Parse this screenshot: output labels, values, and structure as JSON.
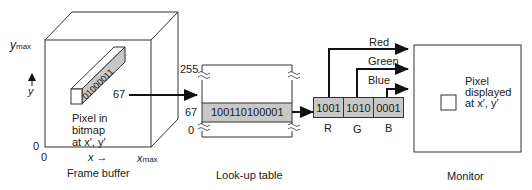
{
  "frame_buffer": {
    "caption": "Frame buffer",
    "y_axis": {
      "max_label": "y",
      "max_sub": "max",
      "var": "y",
      "zero": "0"
    },
    "x_axis": {
      "max_label": "x",
      "max_sub": "max",
      "var": "x",
      "zero": "0",
      "arrow": "→"
    },
    "pixel_bits": "01000011",
    "pixel_label_line1": "Pixel in",
    "pixel_label_line2": "bitmap",
    "pixel_label_line3": "at  x′, y′",
    "index_value": "67"
  },
  "lookup_table": {
    "caption": "Look-up table",
    "top_index": "255",
    "row_index": "67",
    "bottom_index": "0",
    "row_value": "100110100001"
  },
  "rgb": {
    "cells": [
      {
        "value": "1001",
        "label": "R",
        "wire": "Red"
      },
      {
        "value": "1010",
        "label": "G",
        "wire": "Green"
      },
      {
        "value": "0001",
        "label": "B",
        "wire": "Blue"
      }
    ]
  },
  "monitor": {
    "caption": "Monitor",
    "pixel_line1": "Pixel",
    "pixel_line2": "displayed",
    "pixel_line3": "at  x′, y′"
  },
  "colors": {
    "stroke": "#333333",
    "fill_gray": "#c8c8c8",
    "background": "#ffffff"
  }
}
